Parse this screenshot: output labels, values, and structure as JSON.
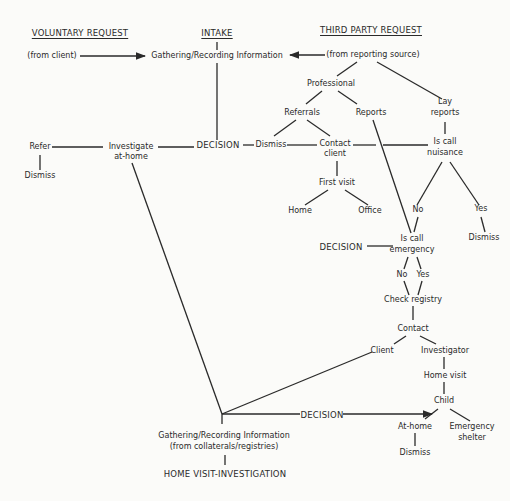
{
  "headers": {
    "voluntary": "VOLUNTARY REQUEST",
    "intake": "INTAKE",
    "third_party": "THIRD PARTY REQUEST"
  },
  "nodes": {
    "from_client": "(from client)",
    "gathering_top": "Gathering/Recording Information",
    "from_reporting_source": "(from reporting source)",
    "professional": "Professional",
    "referrals": "Referrals",
    "reports": "Reports",
    "lay_reports_1": "Lay",
    "lay_reports_2": "reports",
    "refer": "Refer",
    "refer_dismiss": "Dismiss",
    "investigate_1": "Investigate",
    "investigate_2": "at-home",
    "decision_1": "DECISION",
    "dismiss_mid": "Dismiss",
    "contact_client_1": "Contact",
    "contact_client_2": "client",
    "is_call_nuisance_1": "Is call",
    "is_call_nuisance_2": "nuisance",
    "first_visit": "First visit",
    "home": "Home",
    "office": "Office",
    "nuisance_no": "No",
    "nuisance_yes": "Yes",
    "nuisance_dismiss": "Dismiss",
    "decision_2": "DECISION",
    "is_call_emergency_1": "Is call",
    "is_call_emergency_2": "emergency",
    "emergency_no": "No",
    "emergency_yes": "Yes",
    "check_registry": "Check registry",
    "contact": "Contact",
    "client": "Client",
    "investigator": "Investigator",
    "home_visit": "Home visit",
    "child": "Child",
    "decision_3": "DECISION",
    "at_home": "At-home",
    "emergency_shelter_1": "Emergency",
    "emergency_shelter_2": "shelter",
    "at_home_dismiss": "Dismiss",
    "gathering_bottom_1": "Gathering/Recording Information",
    "gathering_bottom_2": "(from collaterals/registries)",
    "home_visit_investigation": "HOME VISIT-INVESTIGATION"
  }
}
